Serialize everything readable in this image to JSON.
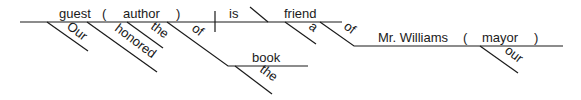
{
  "diagram": {
    "type": "Reed-Kellogg sentence diagram",
    "baseline": {
      "subject": "guest",
      "appositive_open": "(",
      "appositive": "author",
      "appositive_close": ")",
      "verb": "is",
      "predicate_nominative": "friend"
    },
    "subject_modifiers": {
      "our": "Our",
      "honored": "honored",
      "the": "the",
      "of": "of",
      "book": "book",
      "book_the": "the"
    },
    "predicate_modifiers": {
      "a": "a",
      "of": "of",
      "object": "Mr. Williams",
      "appositive_open": "(",
      "appositive": "mayor",
      "appositive_close": ")",
      "our": "our"
    }
  }
}
